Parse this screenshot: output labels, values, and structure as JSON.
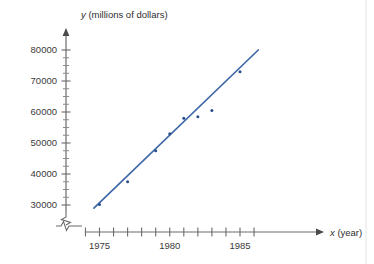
{
  "chart_data": {
    "type": "scatter",
    "title": "",
    "subtitle": "",
    "xlabel": "x (year)",
    "ylabel": "y (millions of dollars)",
    "xlabel_var": "x",
    "xlabel_unit": "(year)",
    "ylabel_var": "y",
    "ylabel_unit": "(millions of dollars)",
    "grid": false,
    "legend": null,
    "xlim": [
      1974.0,
      1986.7
    ],
    "ylim": [
      27500,
      81500
    ],
    "x_tick_labels": [
      "1975",
      "1980",
      "1985"
    ],
    "x_labeled_values": [
      1975,
      1980,
      1985
    ],
    "x_all_ticks": [
      1974,
      1975,
      1976,
      1977,
      1978,
      1979,
      1980,
      1981,
      1982,
      1983,
      1984,
      1985,
      1986
    ],
    "y_tick_labels": [
      "30000",
      "40000",
      "50000",
      "60000",
      "70000",
      "80000"
    ],
    "y_major_values": [
      30000,
      40000,
      50000,
      60000,
      70000,
      80000
    ],
    "y_minor_values": [
      32500,
      35000,
      37500,
      42500,
      45000,
      47500,
      52500,
      55000,
      57500,
      62500,
      65000,
      67500,
      72500,
      75000,
      77500
    ],
    "axis_break_x": true,
    "axis_break_y": true,
    "point_color": "#2a4d8f",
    "line_color": "#3f68a8",
    "axis_color": "#6b6b6b",
    "series": [
      {
        "name": "data points",
        "type": "scatter",
        "points": [
          {
            "x": 1975,
            "y": 30200
          },
          {
            "x": 1977,
            "y": 37500
          },
          {
            "x": 1979,
            "y": 47500
          },
          {
            "x": 1980,
            "y": 53000
          },
          {
            "x": 1981,
            "y": 58000
          },
          {
            "x": 1982,
            "y": 58500
          },
          {
            "x": 1983,
            "y": 60500
          },
          {
            "x": 1985,
            "y": 73000
          }
        ]
      },
      {
        "name": "trend line",
        "type": "line",
        "points": [
          {
            "x": 1974.6,
            "y": 29000
          },
          {
            "x": 1986.3,
            "y": 80000
          }
        ]
      }
    ]
  }
}
